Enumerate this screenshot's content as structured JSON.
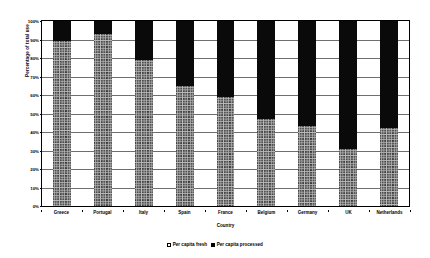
{
  "chart_data": {
    "type": "bar",
    "subtype": "stacked-100-percent",
    "title": "",
    "xlabel": "Country",
    "ylabel": "Percentage of total use",
    "ylim": [
      0,
      100
    ],
    "ytick_labels": [
      "100%",
      "90%",
      "80%",
      "70%",
      "60%",
      "50%",
      "40%",
      "30%",
      "20%",
      "10%",
      "0%"
    ],
    "ytick_values": [
      100,
      90,
      80,
      70,
      60,
      50,
      40,
      30,
      20,
      10,
      0
    ],
    "grid": true,
    "legend_position": "bottom",
    "categories": [
      "Greece",
      "Portugal",
      "Italy",
      "Spain",
      "France",
      "Belgium",
      "Germany",
      "UK",
      "Netherlands"
    ],
    "series": [
      {
        "name": "Per capita fresh",
        "color": "#b9b9b9",
        "pattern": "crosshatch",
        "values": [
          89,
          93,
          79,
          65,
          59,
          47,
          43,
          31,
          42
        ]
      },
      {
        "name": "Per capita processed",
        "color": "#0a0a0a",
        "pattern": "solid",
        "values": [
          11,
          7,
          21,
          35,
          41,
          53,
          57,
          69,
          58
        ]
      }
    ]
  }
}
